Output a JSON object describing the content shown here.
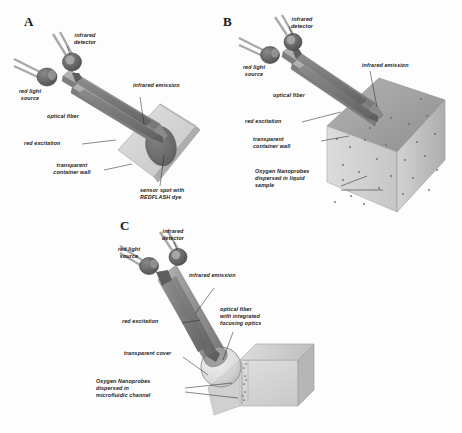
{
  "figure": {
    "type": "schematic-diagram",
    "background_color": "#fdfdfd",
    "panels": [
      {
        "id": "A",
        "letter": "A",
        "description": "Optical oxygen sensor with sensor spot on transparent container wall",
        "labels": [
          {
            "name": "infrared-detector",
            "text": "infrared\ndetector"
          },
          {
            "name": "red-light-source",
            "text": "red light\nsource"
          },
          {
            "name": "infrared-emission",
            "text": "infrared emission"
          },
          {
            "name": "optical-fiber",
            "text": "optical fiber"
          },
          {
            "name": "red-excitation",
            "text": "red excitation"
          },
          {
            "name": "transparent-container-wall",
            "text": "transparent\ncontainer wall"
          },
          {
            "name": "sensor-spot",
            "text": "sensor spot with\nREDFLASH dye"
          }
        ]
      },
      {
        "id": "B",
        "letter": "B",
        "description": "Oxygen nanoprobes dispersed in a liquid sample inside a cuvette",
        "labels": [
          {
            "name": "infrared-detector",
            "text": "infrared\ndetector"
          },
          {
            "name": "red-light-source",
            "text": "red light\nsource"
          },
          {
            "name": "infrared-emission",
            "text": "infrared emission"
          },
          {
            "name": "optical-fiber",
            "text": "optical fiber"
          },
          {
            "name": "red-excitation",
            "text": "red excitation"
          },
          {
            "name": "transparent-container-wall",
            "text": "transparent\ncontainer wall"
          },
          {
            "name": "oxygen-nanoprobes-liquid",
            "text": "Oxygen Nanoprobes\ndispersed in liquid\nsample"
          }
        ]
      },
      {
        "id": "C",
        "letter": "C",
        "description": "Oxygen nanoprobes in a microfluidic channel read through a transparent cover",
        "labels": [
          {
            "name": "infrared-detector",
            "text": "infrared\ndetector"
          },
          {
            "name": "red-light-source",
            "text": "red light\nsource"
          },
          {
            "name": "infrared-emission",
            "text": "infrared emission"
          },
          {
            "name": "optical-fiber-focusing",
            "text": "optical fiber\nwith integrated\nfocusing optics"
          },
          {
            "name": "red-excitation",
            "text": "red excitation"
          },
          {
            "name": "transparent-cover",
            "text": "transparent cover"
          },
          {
            "name": "oxygen-nanoprobes-microfluidic",
            "text": "Oxygen Nanoprobes\ndispersed in\nmicrofluidic channel"
          }
        ]
      }
    ],
    "colors": {
      "led_body": "#5c5c5c",
      "led_lead": "#a8a8a8",
      "fiber": "#8f8f8f",
      "arrow": "#707070",
      "glass_light": "#dcdcdc",
      "glass_mid": "#c2c2c2",
      "glass_dark": "#9a9a9a",
      "sensor_spot": "#6e6e6e",
      "nanoprobe_dot": "#6b6b6b",
      "label_text": "#1b1b1b"
    }
  }
}
